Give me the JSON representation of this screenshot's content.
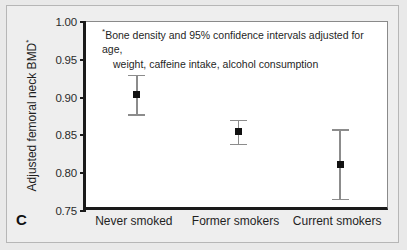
{
  "panel": {
    "label": "C"
  },
  "chart_data": {
    "type": "scatter",
    "title": "",
    "subtitle": "",
    "xlabel": "",
    "ylabel": "Adjusted femoral neck BMD",
    "ylabel_superscript": "*",
    "categories": [
      "Never smoked",
      "Former smokers",
      "Current smokers"
    ],
    "values": [
      0.904,
      0.855,
      0.812
    ],
    "ci_lower": [
      0.878,
      0.839,
      0.766
    ],
    "ci_upper": [
      0.93,
      0.871,
      0.858
    ],
    "error_bar_type": "95% confidence interval",
    "ylim": [
      0.75,
      1.0
    ],
    "yticks": [
      "1.00",
      "0.95",
      "0.90",
      "0.85",
      "0.80",
      "0.75"
    ],
    "ytick_values": [
      1.0,
      0.95,
      0.9,
      0.85,
      0.8,
      0.75
    ],
    "grid": false,
    "legend": "none",
    "annotation_marker": "*",
    "annotation_line1": "Bone density and 95% confidence intervals adjusted for age,",
    "annotation_line2": "weight, caffeine intake, alcohol consumption",
    "marker_color": "#111111",
    "errorbar_color": "#8c8c8c",
    "axis_color": "#1a1a1a",
    "plot_background": "#ffffff",
    "figure_background": "#e9e9e9"
  }
}
